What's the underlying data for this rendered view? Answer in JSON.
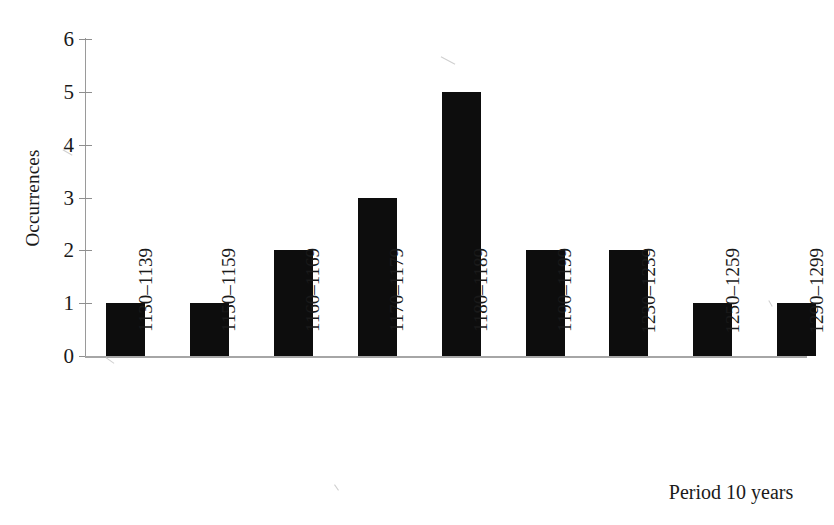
{
  "chart_data": {
    "type": "bar",
    "title": "",
    "subtitle": "",
    "xlabel": "Period 10 years",
    "ylabel": "Occurrences",
    "categories": [
      "1130–1139",
      "1150–1159",
      "1160–1169",
      "1170–1179",
      "1180–1189",
      "1190–1199",
      "1230–1239",
      "1250–1259",
      "1290–1299"
    ],
    "values": [
      1,
      1,
      2,
      3,
      5,
      2,
      2,
      1,
      1
    ],
    "ylim": [
      0,
      6
    ],
    "y_ticks": [
      0,
      1,
      2,
      3,
      4,
      5,
      6
    ],
    "y_tick_labels": [
      "0",
      "1",
      "2",
      "3",
      "4",
      "5",
      "6"
    ],
    "grid": false,
    "legend": null,
    "legend_position": "none",
    "bar_color": "#0d0d0d",
    "axis_color": "#9a9a9a",
    "background_color": "#ffffff",
    "annotations": []
  },
  "axes": {
    "y_title": "Occurrences",
    "x_title": "Period 10 years"
  }
}
